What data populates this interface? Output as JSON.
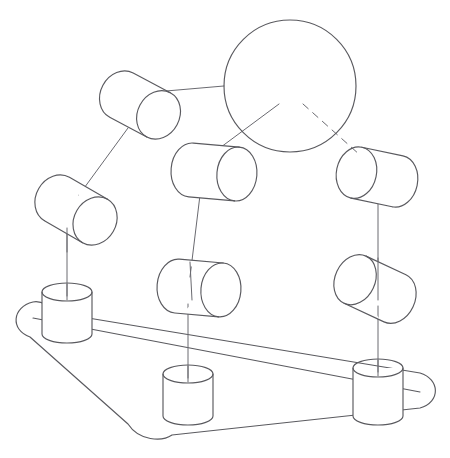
{
  "figure": {
    "kind": "technical-line-drawing",
    "canvas": {
      "width": 450,
      "height": 458,
      "background": "#ffffff"
    },
    "stroke": {
      "color": "#5a5a5f",
      "width": 1.15
    }
  },
  "parts": {
    "moving_platform": {
      "name": "moving-platform-disc",
      "shape": "circle",
      "cx": 290,
      "cy": 86,
      "r": 66
    },
    "base_plate": {
      "name": "base-plate",
      "shape": "rounded-triangle-perspective",
      "corners": [
        {
          "x": 33,
          "y": 322
        },
        {
          "x": 420,
          "y": 392
        },
        {
          "x": 150,
          "y": 437
        }
      ],
      "corner_radius": 26
    },
    "base_pedestals": [
      {
        "name": "base-pedestal-left",
        "cx": 67,
        "cy_top": 292,
        "rx": 25,
        "ry": 9,
        "height": 42
      },
      {
        "name": "base-pedestal-middle",
        "cx": 188,
        "cy_top": 374,
        "rx": 25,
        "ry": 9,
        "height": 42
      },
      {
        "name": "base-pedestal-right",
        "cx": 378,
        "cy_top": 368,
        "rx": 25,
        "ry": 9,
        "height": 48
      }
    ],
    "joint_cylinders": [
      {
        "name": "joint-cylinder-upper-left",
        "leg": "leg-a",
        "position": "upper",
        "cx": 140,
        "cy": 105,
        "rx": 21,
        "ry": 25,
        "length": 42,
        "angle_deg": 28
      },
      {
        "name": "joint-cylinder-lower-left",
        "leg": "leg-a",
        "position": "lower",
        "cx": 76,
        "cy": 210,
        "rx": 21,
        "ry": 25,
        "length": 44,
        "angle_deg": 30
      },
      {
        "name": "joint-cylinder-upper-middle",
        "leg": "leg-b",
        "position": "upper",
        "cx": 214,
        "cy": 172,
        "rx": 20,
        "ry": 27,
        "length": 46,
        "angle_deg": 5
      },
      {
        "name": "joint-cylinder-lower-middle",
        "leg": "leg-b",
        "position": "lower",
        "cx": 199,
        "cy": 288,
        "rx": 20,
        "ry": 27,
        "length": 44,
        "angle_deg": 5
      },
      {
        "name": "joint-cylinder-upper-right",
        "leg": "leg-c",
        "position": "upper",
        "cx": 377,
        "cy": 177,
        "rx": 20,
        "ry": 26,
        "length": 42,
        "angle_deg": 12
      },
      {
        "name": "joint-cylinder-lower-right",
        "leg": "leg-c",
        "position": "lower",
        "cx": 375,
        "cy": 289,
        "rx": 20,
        "ry": 26,
        "length": 44,
        "angle_deg": 25
      }
    ],
    "links": [
      {
        "name": "link-platform-to-upper-left",
        "style": "solid",
        "x1": 224,
        "y1": 86,
        "x2": 166,
        "y2": 91
      },
      {
        "name": "link-platform-to-upper-middle",
        "style": "solid",
        "x1": 279,
        "y1": 104,
        "x2": 213,
        "y2": 153
      },
      {
        "name": "link-platform-to-upper-right",
        "style": "dashed",
        "x1": 303,
        "y1": 104,
        "x2": 360,
        "y2": 155
      },
      {
        "name": "link-upper-left-to-lower-left",
        "style": "solid",
        "x1": 128,
        "y1": 128,
        "x2": 79,
        "y2": 195
      },
      {
        "name": "link-lower-left-to-pedestal",
        "style": "solid",
        "x1": 67,
        "y1": 228,
        "x2": 67,
        "y2": 296
      },
      {
        "name": "link-upper-middle-to-lower-middle",
        "style": "solid",
        "x1": 200,
        "y1": 195,
        "x2": 190,
        "y2": 277
      },
      {
        "name": "link-lower-middle-to-pedestal",
        "style": "solid",
        "x1": 188,
        "y1": 304,
        "x2": 188,
        "y2": 378
      },
      {
        "name": "link-upper-right-to-lower-right",
        "style": "solid",
        "x1": 378,
        "y1": 204,
        "x2": 378,
        "y2": 272
      },
      {
        "name": "link-lower-right-to-pedestal",
        "style": "solid",
        "x1": 378,
        "y1": 306,
        "x2": 378,
        "y2": 372
      }
    ]
  }
}
